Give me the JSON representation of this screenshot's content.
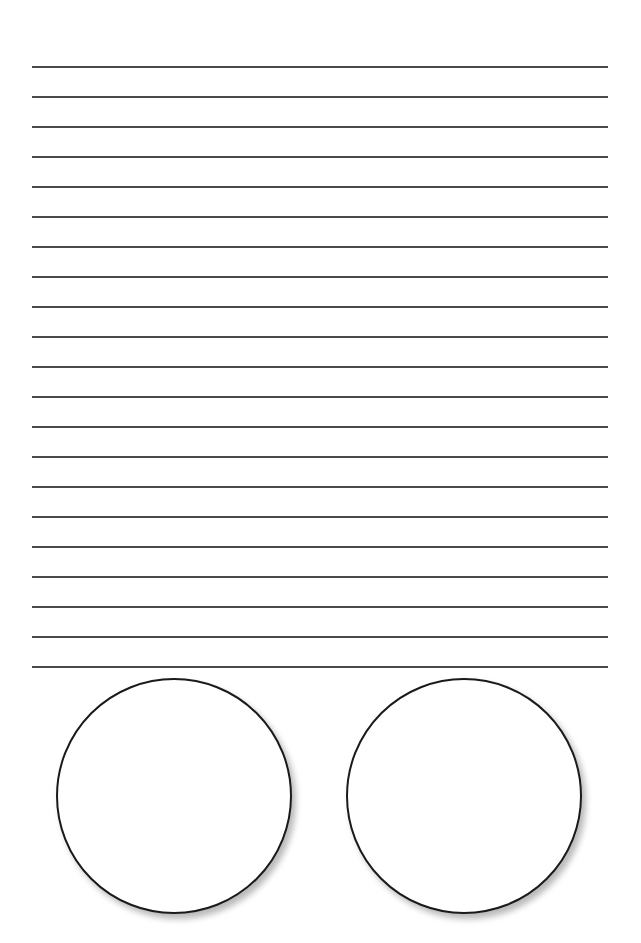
{
  "page": {
    "background": "#ffffff",
    "line_color": "#4a4a4a",
    "circle_stroke": "#1a1a1a"
  },
  "ruled_lines": {
    "count": 21,
    "first_y": 66,
    "spacing": 30,
    "x_start": 32,
    "x_end": 608
  },
  "circles": [
    {
      "name": "left-circle",
      "cx": 174,
      "cy": 796,
      "r": 118
    },
    {
      "name": "right-circle",
      "cx": 464,
      "cy": 796,
      "r": 118
    }
  ]
}
